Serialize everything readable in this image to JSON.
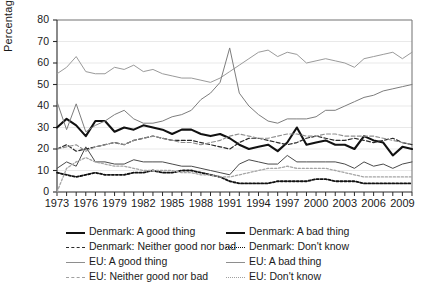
{
  "chart_data": {
    "type": "line",
    "title": "",
    "xlabel": "",
    "ylabel": "Percentage",
    "xlim": [
      1973,
      2010
    ],
    "ylim": [
      0,
      80
    ],
    "ytick_labels": [
      "0",
      "10",
      "20",
      "30",
      "40",
      "50",
      "60",
      "70",
      "80"
    ],
    "ytick_values": [
      0,
      10,
      20,
      30,
      40,
      50,
      60,
      70,
      80
    ],
    "xtick_labels": [
      "1973",
      "1976",
      "1979",
      "1982",
      "1985",
      "1988",
      "1991",
      "1994",
      "1997",
      "2000",
      "2003",
      "2006",
      "2009"
    ],
    "xtick_values": [
      1973,
      1976,
      1979,
      1982,
      1985,
      1988,
      1991,
      1994,
      1997,
      2000,
      2003,
      2006,
      2009
    ],
    "grid": true,
    "legend_position": "below",
    "x": [
      1973,
      1974,
      1975,
      1976,
      1977,
      1978,
      1979,
      1980,
      1981,
      1982,
      1983,
      1984,
      1985,
      1986,
      1987,
      1988,
      1989,
      1990,
      1991,
      1992,
      1993,
      1994,
      1995,
      1996,
      1997,
      1998,
      1999,
      2000,
      2001,
      2002,
      2003,
      2004,
      2005,
      2006,
      2007,
      2008,
      2009,
      2010
    ],
    "series": [
      {
        "name": "Denmark: A good thing",
        "color": "#111111",
        "style": "solid",
        "width": 2.1,
        "values": [
          30,
          34,
          31,
          26,
          33,
          33,
          28,
          30,
          29,
          31,
          30,
          29,
          27,
          29,
          29,
          27,
          26,
          27,
          25,
          22,
          20,
          21,
          22,
          19,
          23,
          30,
          22,
          23,
          24,
          22,
          22,
          20,
          26,
          24,
          23,
          17,
          21,
          20
        ]
      },
      {
        "name": "Denmark: A bad thing",
        "color": "#4a4a4a",
        "style": "solid",
        "width": 1.0,
        "values": [
          11,
          14,
          12,
          21,
          14,
          14,
          13,
          13,
          15,
          14,
          14,
          14,
          13,
          12,
          12,
          11,
          10,
          9,
          8,
          13,
          15,
          14,
          13,
          13,
          17,
          14,
          14,
          14,
          14,
          14,
          13,
          11,
          14,
          12,
          13,
          11,
          13,
          14
        ]
      },
      {
        "name": "Denmark: Neither good nor bad",
        "color": "#2a2a2a",
        "style": "dashed",
        "width": 1.2,
        "values": [
          20,
          22,
          19,
          20,
          21,
          22,
          23,
          22,
          24,
          25,
          26,
          25,
          24,
          24,
          24,
          23,
          22,
          21,
          20,
          23,
          25,
          25,
          24,
          23,
          22,
          23,
          25,
          26,
          25,
          24,
          24,
          25,
          24,
          23,
          24,
          25,
          23,
          22
        ]
      },
      {
        "name": "Denmark: Don't know",
        "color": "#111111",
        "style": "dotted",
        "width": 1.8,
        "values": [
          9,
          8,
          7,
          8,
          9,
          8,
          8,
          8,
          9,
          9,
          10,
          9,
          9,
          10,
          10,
          9,
          8,
          7,
          5,
          4,
          4,
          4,
          4,
          5,
          5,
          5,
          5,
          6,
          6,
          5,
          5,
          5,
          4,
          4,
          4,
          4,
          4,
          4
        ]
      },
      {
        "name": "EU: A good thing",
        "color": "#9a9a9a",
        "style": "solid",
        "width": 1.0,
        "values": [
          55,
          58,
          63,
          56,
          55,
          55,
          58,
          57,
          59,
          56,
          57,
          55,
          54,
          53,
          53,
          52,
          51,
          53,
          56,
          59,
          62,
          65,
          66,
          63,
          65,
          64,
          60,
          61,
          62,
          61,
          60,
          58,
          62,
          63,
          64,
          65,
          62,
          65
        ]
      },
      {
        "name": "EU: A bad thing",
        "color": "#7d7d7d",
        "style": "solid",
        "width": 1.0,
        "values": [
          42,
          29,
          41,
          28,
          31,
          33,
          36,
          38,
          34,
          32,
          32,
          33,
          35,
          36,
          38,
          43,
          46,
          51,
          67,
          46,
          40,
          36,
          33,
          32,
          34,
          34,
          34,
          35,
          38,
          38,
          40,
          42,
          44,
          45,
          47,
          48,
          49,
          50
        ]
      },
      {
        "name": "EU: Neither good nor bad",
        "color": "#8e8e8e",
        "style": "dashed",
        "width": 1.1,
        "values": [
          20,
          21,
          22,
          19,
          21,
          22,
          23,
          22,
          24,
          25,
          26,
          25,
          24,
          23,
          23,
          22,
          23,
          24,
          26,
          27,
          26,
          25,
          25,
          26,
          27,
          27,
          26,
          26,
          27,
          27,
          26,
          26,
          26,
          26,
          25,
          24,
          23,
          22
        ]
      },
      {
        "name": "EU: Don't know",
        "color": "#a5a5a5",
        "style": "dotted",
        "width": 1.3,
        "values": [
          0,
          11,
          14,
          16,
          14,
          13,
          12,
          12,
          11,
          10,
          10,
          10,
          10,
          9,
          9,
          8,
          8,
          7,
          7,
          8,
          9,
          10,
          11,
          11,
          12,
          11,
          11,
          11,
          11,
          10,
          9,
          8,
          7,
          7,
          7,
          7,
          7,
          7
        ]
      }
    ]
  },
  "legend": {
    "items": [
      {
        "label": "Denmark: A good thing",
        "style": "solid",
        "color": "#111111",
        "width": 2.1
      },
      {
        "label": "Denmark: A bad thing",
        "style": "solid",
        "color": "#111111",
        "width": 2.1
      },
      {
        "label": "Denmark: Neither good nor bad",
        "style": "dashed",
        "color": "#2a2a2a",
        "width": 1.3
      },
      {
        "label": "Denmark: Don't know",
        "style": "dotted",
        "color": "#111111",
        "width": 1.8
      },
      {
        "label": "EU: A good thing",
        "style": "solid",
        "color": "#8e8e8e",
        "width": 1.1
      },
      {
        "label": "EU: A bad thing",
        "style": "solid",
        "color": "#8e8e8e",
        "width": 1.1
      },
      {
        "label": "EU: Neither good nor bad",
        "style": "dashed",
        "color": "#a0a0a0",
        "width": 1.1
      },
      {
        "label": "EU: Don't know",
        "style": "dotted",
        "color": "#a0a0a0",
        "width": 1.4
      }
    ]
  }
}
